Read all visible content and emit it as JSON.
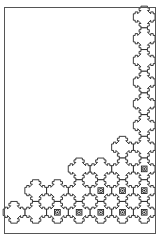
{
  "document": {
    "title": "Interlocking Cross-Tile Tiling Figure",
    "kind": "line-drawing",
    "width": 163,
    "height": 241
  },
  "colors": {
    "background": "#ffffff",
    "stroke": "#1a1a1a",
    "frame_stroke": "#555555",
    "fill": "#ffffff"
  },
  "frame": {
    "x": 4.5,
    "y": 7.5,
    "width": 151,
    "height": 226,
    "stroke_width": 1
  },
  "tiling": {
    "shape_name": "notched-cross-tile",
    "grid_origin_x": 14.0,
    "grid_origin_y": 17.0,
    "cell_size": 21.7,
    "tile_stroke_width": 0.85,
    "marker_radius": 2.1,
    "marker_inner_radius": 0.9,
    "columns": 7,
    "rows": 10,
    "tiles": [
      {
        "col": 6,
        "row": 0,
        "marker": false
      },
      {
        "col": 6,
        "row": 1,
        "marker": false
      },
      {
        "col": 6,
        "row": 2,
        "marker": false
      },
      {
        "col": 6,
        "row": 3,
        "marker": false
      },
      {
        "col": 6,
        "row": 4,
        "marker": false
      },
      {
        "col": 6,
        "row": 5,
        "marker": false
      },
      {
        "col": 6,
        "row": 6,
        "marker": false
      },
      {
        "col": 5,
        "row": 6,
        "marker": false
      },
      {
        "col": 6,
        "row": 7,
        "marker": true
      },
      {
        "col": 5,
        "row": 7,
        "marker": false
      },
      {
        "col": 4,
        "row": 7,
        "marker": false
      },
      {
        "col": 3,
        "row": 7,
        "marker": false
      },
      {
        "col": 6,
        "row": 8,
        "marker": true
      },
      {
        "col": 5,
        "row": 8,
        "marker": true
      },
      {
        "col": 4,
        "row": 8,
        "marker": true
      },
      {
        "col": 3,
        "row": 8,
        "marker": false
      },
      {
        "col": 2,
        "row": 8,
        "marker": false
      },
      {
        "col": 1,
        "row": 8,
        "marker": false
      },
      {
        "col": 6,
        "row": 9,
        "marker": true
      },
      {
        "col": 5,
        "row": 9,
        "marker": true
      },
      {
        "col": 4,
        "row": 9,
        "marker": true
      },
      {
        "col": 3,
        "row": 9,
        "marker": true
      },
      {
        "col": 2,
        "row": 9,
        "marker": true
      },
      {
        "col": 1,
        "row": 9,
        "marker": false
      },
      {
        "col": 0,
        "row": 9,
        "marker": false
      }
    ]
  }
}
